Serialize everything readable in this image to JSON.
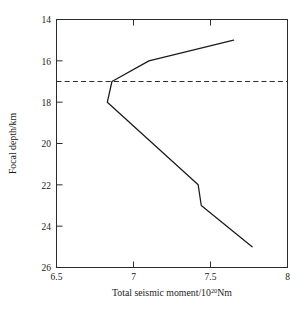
{
  "chart_data": {
    "type": "line",
    "title": "",
    "xlabel": "Total seismic moment/10",
    "xlabel_exponent": "20",
    "xlabel_suffix": "Nm",
    "ylabel": "Focal depth/km",
    "xlim": [
      6.5,
      8
    ],
    "ylim": [
      14,
      26
    ],
    "y_inverted": true,
    "grid": false,
    "legend": null,
    "xticks": [
      "6.5",
      "7",
      "7.5",
      "8"
    ],
    "xtick_values": [
      6.5,
      7,
      7.5,
      8
    ],
    "yticks": [
      "14",
      "16",
      "18",
      "20",
      "22",
      "24",
      "26"
    ],
    "ytick_values": [
      14,
      16,
      18,
      20,
      22,
      24,
      26
    ],
    "series": [
      {
        "name": "Total seismic moment vs focal depth",
        "x": [
          7.65,
          7.1,
          6.86,
          6.83,
          7.42,
          7.44,
          7.77
        ],
        "y": [
          15,
          16,
          17,
          18,
          22,
          23,
          25
        ]
      }
    ],
    "annotations": [
      {
        "name": "reference-depth-line",
        "type": "hline",
        "y": 17,
        "style": "dashed",
        "label": ""
      }
    ]
  },
  "figure": {
    "background_color": "#ffffff",
    "line_color": "#1a1a1a",
    "axis_color": "#2b2b2b"
  }
}
